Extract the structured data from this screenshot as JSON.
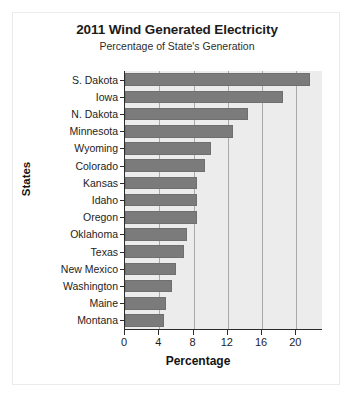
{
  "chart_data": {
    "type": "bar",
    "orientation": "horizontal",
    "title": "2011 Wind Generated Electricity",
    "subtitle": "Percentage of State's Generation",
    "xlabel": "Percentage",
    "ylabel": "States",
    "categories": [
      "S. Dakota",
      "Iowa",
      "N. Dakota",
      "Minnesota",
      "Wyoming",
      "Colorado",
      "Kansas",
      "Idaho",
      "Oregon",
      "Oklahoma",
      "Texas",
      "New Mexico",
      "Washington",
      "Maine",
      "Montana"
    ],
    "values": [
      21.6,
      18.4,
      14.4,
      12.6,
      10.0,
      9.3,
      8.4,
      8.4,
      8.4,
      7.2,
      6.9,
      5.9,
      5.5,
      4.8,
      4.5
    ],
    "xlim": [
      0,
      23
    ],
    "xticks": [
      0,
      4,
      8,
      12,
      16,
      20
    ],
    "xtick_labels": [
      "0",
      "4",
      "8",
      "12",
      "16",
      "20"
    ],
    "grid": true,
    "grid_axis": "x",
    "legend": false,
    "colors": {
      "bar": "#7b7b7b",
      "bar_border": "#6f6f6f",
      "plot_background": "#ececec",
      "gridline": "#a9a9a9",
      "axis": "#2b2b2b",
      "text": "#1d1d1d",
      "card_background": "#ffffff",
      "card_border": "#eceaea"
    }
  }
}
